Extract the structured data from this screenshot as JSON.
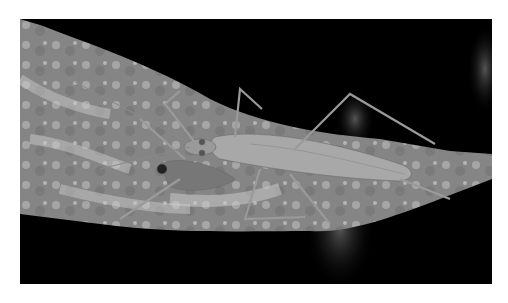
{
  "image": {
    "subject": "assassin bug on leaf",
    "tone": "grayscale",
    "background": "#000000",
    "frame_color": "#ffffff",
    "leaf_color": "#8c8c8c",
    "insect_color": "#a8a8a8"
  }
}
